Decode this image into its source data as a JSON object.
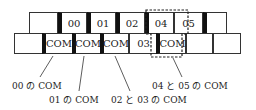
{
  "top_row": [
    {
      "label": "",
      "x": 29,
      "w": 29,
      "thick_left": false
    },
    {
      "label": "00",
      "x": 58,
      "w": 29,
      "thick_left": true
    },
    {
      "label": "01",
      "x": 87,
      "w": 29,
      "thick_left": true
    },
    {
      "label": "02",
      "x": 116,
      "w": 29,
      "thick_left": true
    },
    {
      "label": "04",
      "x": 145,
      "w": 29,
      "thick_left": true
    },
    {
      "label": "05",
      "x": 174,
      "w": 29,
      "thick_left": false
    },
    {
      "label": "",
      "x": 203,
      "w": 24,
      "thick_left": true
    }
  ],
  "bottom_row": [
    {
      "label": "",
      "x": 14,
      "w": 29,
      "thick_left": false
    },
    {
      "label": "COM",
      "x": 42,
      "w": 31,
      "thick_left": true
    },
    {
      "label": "COM",
      "x": 72,
      "w": 29,
      "thick_left": true
    },
    {
      "label": "COM",
      "x": 100,
      "w": 29,
      "thick_left": true
    },
    {
      "label": "03",
      "x": 129,
      "w": 29,
      "thick_left": false
    },
    {
      "label": "COM",
      "x": 156,
      "w": 30,
      "thick_left": true
    },
    {
      "label": "",
      "x": 186,
      "w": 27,
      "thick_left": false
    },
    {
      "label": "",
      "x": 213,
      "w": 28,
      "thick_left": false
    }
  ],
  "annotations": {
    "a00": "00 の COM",
    "a01": "01 の COM",
    "a0203": "02 と 03 の COM",
    "a0405": "04 と 05 の COM"
  }
}
